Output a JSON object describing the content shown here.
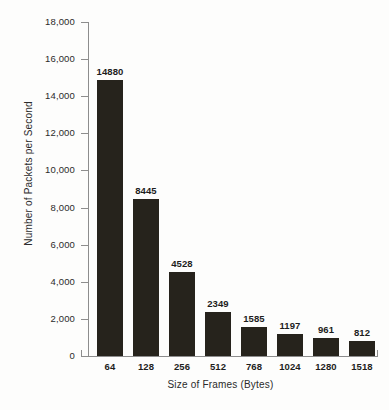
{
  "chart_data": {
    "type": "bar",
    "title": "",
    "xlabel": "Size of Frames (Bytes)",
    "ylabel": "Number of Packets per Second",
    "categories": [
      "64",
      "128",
      "256",
      "512",
      "768",
      "1024",
      "1280",
      "1518"
    ],
    "values": [
      14880,
      8445,
      4528,
      2349,
      1585,
      1197,
      961,
      812
    ],
    "value_labels": [
      "14880",
      "8445",
      "4528",
      "2349",
      "1585",
      "1197",
      "961",
      "812"
    ],
    "ylim": [
      0,
      18000
    ],
    "ytick_values": [
      0,
      2000,
      4000,
      6000,
      8000,
      10000,
      12000,
      14000,
      16000,
      18000
    ],
    "ytick_labels": [
      "0",
      "2,000",
      "4,000",
      "6,000",
      "8,000",
      "10,000",
      "12,000",
      "14,000",
      "16,000",
      "18,000"
    ],
    "grid": false,
    "legend": null,
    "bar_color": "#26231c",
    "axis_color": "#8d8d8d",
    "background_color": "#fdfdfc"
  }
}
